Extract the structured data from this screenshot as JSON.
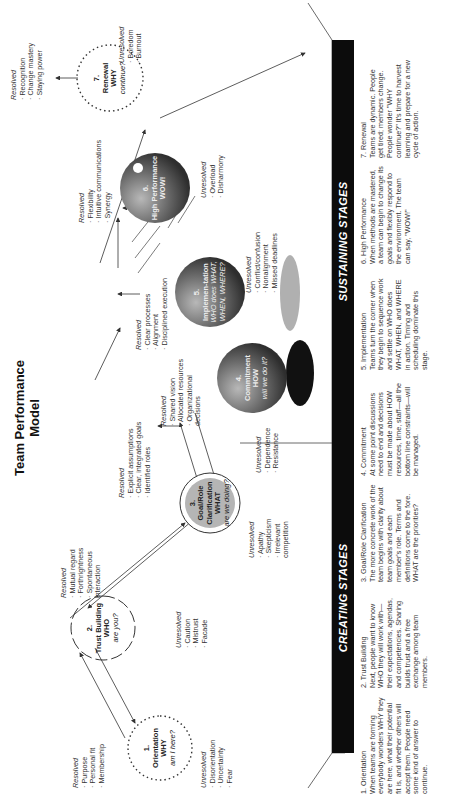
{
  "title": {
    "line1": "Team Performance",
    "line2": "Model"
  },
  "bars": {
    "creating": "CREATING STAGES",
    "sustaining": "SUSTAINING STAGES"
  },
  "colors": {
    "bar": "#0c0c0c",
    "sphere_dark": "#3a3a3a",
    "sphere_light": "#9a9a9a",
    "goal_fill": "#b5b5b5",
    "shadow": "#b0b0b0"
  },
  "stages": [
    {
      "num": "1.",
      "name": "Orientation",
      "key": "WHY",
      "question": "am I here?",
      "resolved_label": "Resolved",
      "resolved": [
        "Purpose",
        "Personal fit",
        "Membership"
      ],
      "unresolved_label": "Unresolved",
      "unresolved": [
        "Disorientation",
        "Uncertainty",
        "Fear"
      ]
    },
    {
      "num": "2.",
      "name": "Trust Building",
      "key": "WHO",
      "question": "are you?",
      "resolved_label": "Resolved",
      "resolved": [
        "Mutual regard",
        "Forthrightness",
        "Spontaneous interaction"
      ],
      "unresolved_label": "Unresolved",
      "unresolved": [
        "Caution",
        "Mistrust",
        "Facade"
      ]
    },
    {
      "num": "3.",
      "name": "Goal/Role Clarification",
      "key": "WHAT",
      "question": "are we doing?",
      "resolved_label": "Resolved",
      "resolved": [
        "Explicit assumptions",
        "Clear, integrated goals",
        "Identified roles"
      ],
      "unresolved_label": "Unresolved",
      "unresolved": [
        "Apathy",
        "Skepticism",
        "Irrelevant competition"
      ]
    },
    {
      "num": "4.",
      "name": "Commitment",
      "key": "HOW",
      "question": "will we do it?",
      "resolved_label": "Resolved",
      "resolved": [
        "Shared vision",
        "Allocated resources",
        "Organizational decisions"
      ],
      "unresolved_label": "Unresolved",
      "unresolved": [
        "Dependence",
        "Resistance"
      ]
    },
    {
      "num": "5.",
      "name": "Implemen-tation",
      "key": "WHO does WHAT, WHEN, WHERE?",
      "question": "",
      "resolved_label": "Resolved",
      "resolved": [
        "Clear processes",
        "Alignment",
        "Disciplined execution"
      ],
      "unresolved_label": "Unresolved",
      "unresolved": [
        "Conflict/confusion",
        "Nonalignment",
        "Missed deadlines"
      ]
    },
    {
      "num": "6.",
      "name": "High Performance",
      "key": "WOW!",
      "question": "",
      "resolved_label": "Resolved",
      "resolved": [
        "Flexibility",
        "Intuitive communications",
        "Synergy"
      ],
      "unresolved_label": "Unresolved",
      "unresolved": [
        "Overload",
        "Disharmony"
      ]
    },
    {
      "num": "7.",
      "name": "Renewal",
      "key": "WHY",
      "question": "continue?",
      "resolved_label": "Resolved",
      "resolved": [
        "Recognition",
        "Change mastery",
        "Staying power"
      ],
      "unresolved_label": "Unresolved",
      "unresolved": [
        "Boredom",
        "Burnout"
      ]
    }
  ],
  "descriptions": [
    {
      "name": "1. Orientation",
      "text": "When teams are forming everybody wonders WHY they are here, what their potential fit is, and whether others will accept them. People need some kind of answer to continue."
    },
    {
      "name": "2. Trust Building",
      "text": "Next, people want to know WHO they will work with—their expectations, agendas, and competencies. Sharing builds trust and a free exchange among team members."
    },
    {
      "name": "3. Goal/Role Clarification",
      "text": "The more concrete work of the team begins with clarity about team goals and each member's role. Terms and definitions come to the fore. WHAT are the priorities?"
    },
    {
      "name": "4. Commitment",
      "text": "At some point discussions need to end and decisions must be made about HOW resources, time, staff—all the bottom line constraints—will be managed."
    },
    {
      "name": "5. Implementation",
      "text": "Teams turn the corner when they begin to sequence work and settle on WHO does WHAT, WHEN, and WHERE in action. Timing and scheduling dominate this stage."
    },
    {
      "name": "6. High Performance",
      "text": "When methods are mastered, a team can begin to change its goals and flexibly respond to the environment. The team can say, \"WOW!\""
    },
    {
      "name": "7. Renewal",
      "text": "Teams are dynamic. People get tired; members change. People wonder \"WHY continue?\" It's time to harvest learning and prepare for a new cycle of action."
    }
  ]
}
